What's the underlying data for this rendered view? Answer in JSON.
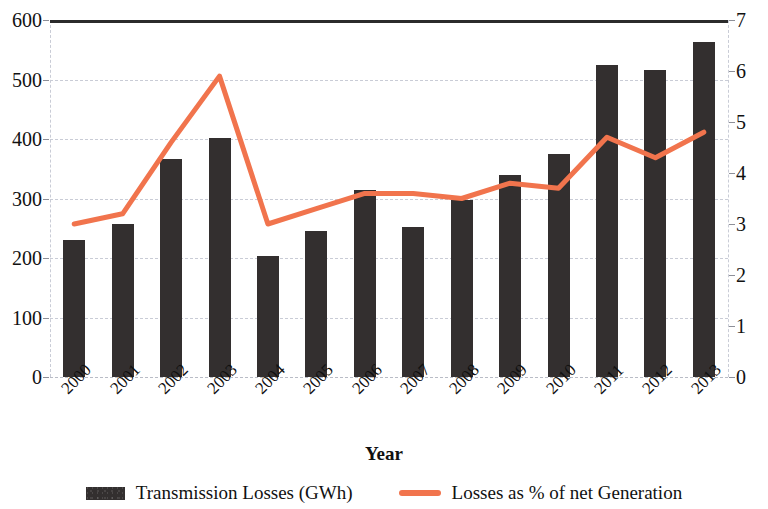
{
  "chart_data": {
    "type": "bar",
    "title": "",
    "xlabel": "Year",
    "ylabel": "",
    "categories": [
      "2000",
      "2001",
      "2002",
      "2003",
      "2004",
      "2005",
      "2006",
      "2007",
      "2008",
      "2009",
      "2010",
      "2011",
      "2012",
      "2013"
    ],
    "series": [
      {
        "name": "Transmission Losses (GWh)",
        "type": "bar",
        "axis": "left",
        "color": "#332f2f",
        "values": [
          230,
          258,
          366,
          401,
          204,
          246,
          314,
          252,
          297,
          339,
          374,
          525,
          516,
          563
        ]
      },
      {
        "name": "Losses as % of net Generation",
        "type": "line",
        "axis": "right",
        "color": "#f1744d",
        "values": [
          3.0,
          3.2,
          4.6,
          5.9,
          3.0,
          3.3,
          3.6,
          3.6,
          3.5,
          3.8,
          3.7,
          4.7,
          4.3,
          4.8
        ]
      }
    ],
    "left_axis": {
      "ticks": [
        "0",
        "100",
        "200",
        "300",
        "400",
        "500",
        "600"
      ],
      "ylim": [
        0,
        600
      ]
    },
    "right_axis": {
      "ticks": [
        "0",
        "1",
        "2",
        "3",
        "4",
        "5",
        "6",
        "7"
      ],
      "ylim": [
        0,
        7
      ]
    },
    "grid": true,
    "legend_position": "bottom"
  },
  "legend": {
    "items": [
      {
        "label": "Transmission Losses (GWh)",
        "marker": "bar-swatch-icon"
      },
      {
        "label": "Losses as % of net Generation",
        "marker": "line-swatch-icon"
      }
    ]
  }
}
